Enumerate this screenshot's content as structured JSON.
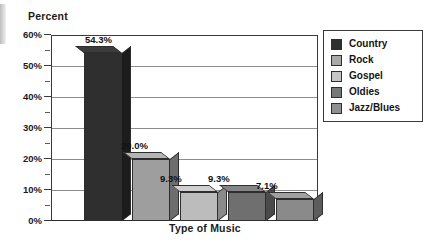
{
  "chart_data": {
    "type": "bar",
    "title": "",
    "xlabel": "Type of Music",
    "ylabel": "Percent",
    "categories": [
      "Country",
      "Rock",
      "Gospel",
      "Oldies",
      "Jazz/Blues"
    ],
    "values": [
      54.3,
      20.0,
      9.3,
      9.3,
      7.1
    ],
    "data_labels": [
      "54.3%",
      "20.0%",
      "9.3%",
      "9.3%",
      "7.1%"
    ],
    "ylim": [
      0,
      60
    ],
    "ytick_labels": [
      "60%",
      "50%",
      "40%",
      "30%",
      "20%",
      "10%",
      "0%"
    ],
    "ytick_values": [
      60,
      50,
      40,
      30,
      20,
      10,
      0
    ],
    "yminor_tick_values": [
      55,
      45,
      35,
      25,
      15,
      5
    ],
    "grid": "horizontal",
    "legend_position": "right",
    "style": "3d-bar-grayscale",
    "series": [
      {
        "name": "Percent",
        "points": [
          {
            "category": "Country",
            "value": 54.3,
            "label": "54.3%",
            "color": "#2f2f2f",
            "side_color": "#1c1c1c",
            "top_color": "#3c3c3c"
          },
          {
            "category": "Rock",
            "value": 20.0,
            "label": "20.0%",
            "color": "#9e9e9e",
            "side_color": "#6d6d6d",
            "top_color": "#b4b4b4"
          },
          {
            "category": "Gospel",
            "value": 9.3,
            "label": "9.3%",
            "color": "#bcbcbc",
            "side_color": "#8a8a8a",
            "top_color": "#cfcfcf"
          },
          {
            "category": "Oldies",
            "value": 9.3,
            "label": "9.3%",
            "color": "#6f6f6f",
            "side_color": "#4a4a4a",
            "top_color": "#858585"
          },
          {
            "category": "Jazz/Blues",
            "value": 7.1,
            "label": "7.1%",
            "color": "#8a8a8a",
            "side_color": "#5c5c5c",
            "top_color": "#a0a0a0"
          }
        ]
      }
    ]
  },
  "legend": {
    "items": [
      {
        "label": "Country",
        "color": "#2f2f2f"
      },
      {
        "label": "Rock",
        "color": "#a8a8a8"
      },
      {
        "label": "Gospel",
        "color": "#c6c6c6"
      },
      {
        "label": "Oldies",
        "color": "#777777"
      },
      {
        "label": "Jazz/Blues",
        "color": "#8f8f8f"
      }
    ]
  },
  "colors": {
    "axis": "#3a3a3a",
    "grid": "#8d8d8d",
    "text": "#1b1b1b",
    "background": "#ffffff"
  }
}
